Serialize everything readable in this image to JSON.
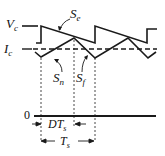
{
  "diagram": {
    "labels": {
      "vc": "V",
      "vc_sub": "c",
      "ic": "I",
      "ic_sub": "c",
      "se": "S",
      "se_sub": "e",
      "sn": "S",
      "sn_sub": "n",
      "sf": "S",
      "sf_sub": "f",
      "zero": "0",
      "dts": "DT",
      "dts_sub": "s",
      "ts": "T",
      "ts_sub": "s"
    },
    "colors": {
      "line": "#1a1a1a",
      "background": "#ffffff"
    }
  }
}
